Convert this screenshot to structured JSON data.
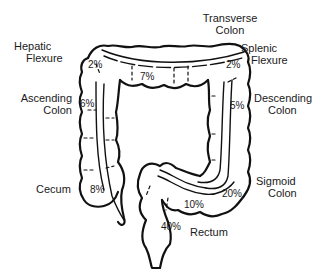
{
  "diagram": {
    "regions": [
      {
        "id": "transverse",
        "label_line1": "Transverse",
        "label_line2": "Colon",
        "percent": "7%"
      },
      {
        "id": "hepatic",
        "label_line1": "Hepatic",
        "label_line2": "Flexure",
        "percent": "2%"
      },
      {
        "id": "splenic",
        "label_line1": "Splenic",
        "label_line2": "Flexure",
        "percent": "2%"
      },
      {
        "id": "ascending",
        "label_line1": "Ascending",
        "label_line2": "Colon",
        "percent": "6%"
      },
      {
        "id": "descending",
        "label_line1": "Descending",
        "label_line2": "Colon",
        "percent": "5%"
      },
      {
        "id": "cecum",
        "label_line1": "Cecum",
        "label_line2": "",
        "percent": "8%"
      },
      {
        "id": "sigmoid",
        "label_line1": "Sigmoid",
        "label_line2": "Colon",
        "percent": "20%"
      },
      {
        "id": "rectum",
        "label_line1": "Rectum",
        "label_line2": "",
        "percent": "40%"
      },
      {
        "id": "rectosigmoid",
        "label_line1": "",
        "label_line2": "",
        "percent": "10%"
      }
    ]
  }
}
